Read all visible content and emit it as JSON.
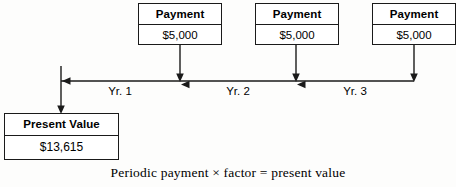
{
  "diagram": {
    "stroke_color": "#1a1a1a",
    "background_color": "#fdfdfc",
    "text_color": "#000000"
  },
  "payments": [
    {
      "header": "Payment",
      "amount": "$5,000"
    },
    {
      "header": "Payment",
      "amount": "$5,000"
    },
    {
      "header": "Payment",
      "amount": "$5,000"
    }
  ],
  "present_value": {
    "header": "Present Value",
    "amount": "$13,615"
  },
  "timeline": {
    "periods": [
      {
        "label": "Yr. 1"
      },
      {
        "label": "Yr. 2"
      },
      {
        "label": "Yr. 3"
      }
    ]
  },
  "caption": {
    "text": "Periodic payment × factor = present value"
  },
  "icons": {
    "arrow_down": "arrow-down-icon",
    "arrow_left": "arrow-left-icon"
  }
}
